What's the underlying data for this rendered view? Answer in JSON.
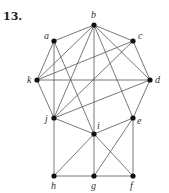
{
  "problem_number": "13.",
  "graph": {
    "nodes": [
      {
        "id": "a",
        "x": 54,
        "y": 41,
        "lx": 44,
        "ly": 39
      },
      {
        "id": "b",
        "x": 94,
        "y": 25,
        "lx": 91,
        "ly": 18
      },
      {
        "id": "c",
        "x": 133,
        "y": 41,
        "lx": 138,
        "ly": 39
      },
      {
        "id": "k",
        "x": 37,
        "y": 80,
        "lx": 27,
        "ly": 83
      },
      {
        "id": "d",
        "x": 150,
        "y": 80,
        "lx": 155,
        "ly": 83
      },
      {
        "id": "j",
        "x": 54,
        "y": 118,
        "lx": 45,
        "ly": 122
      },
      {
        "id": "e",
        "x": 133,
        "y": 118,
        "lx": 137,
        "ly": 124
      },
      {
        "id": "i",
        "x": 94,
        "y": 134,
        "lx": 97,
        "ly": 129
      },
      {
        "id": "h",
        "x": 54,
        "y": 176,
        "lx": 51,
        "ly": 189
      },
      {
        "id": "g",
        "x": 94,
        "y": 176,
        "lx": 91,
        "ly": 189
      },
      {
        "id": "f",
        "x": 133,
        "y": 176,
        "lx": 130,
        "ly": 189
      }
    ],
    "edges": [
      [
        "a",
        "b"
      ],
      [
        "b",
        "c"
      ],
      [
        "c",
        "d"
      ],
      [
        "d",
        "e"
      ],
      [
        "e",
        "f"
      ],
      [
        "f",
        "g"
      ],
      [
        "g",
        "h"
      ],
      [
        "h",
        "j"
      ],
      [
        "j",
        "k"
      ],
      [
        "k",
        "a"
      ],
      [
        "a",
        "j"
      ],
      [
        "a",
        "i"
      ],
      [
        "b",
        "k"
      ],
      [
        "b",
        "d"
      ],
      [
        "b",
        "j"
      ],
      [
        "b",
        "i"
      ],
      [
        "b",
        "e"
      ],
      [
        "c",
        "k"
      ],
      [
        "c",
        "j"
      ],
      [
        "d",
        "k"
      ],
      [
        "d",
        "j"
      ],
      [
        "j",
        "i"
      ],
      [
        "i",
        "e"
      ],
      [
        "i",
        "h"
      ],
      [
        "i",
        "g"
      ],
      [
        "i",
        "f"
      ],
      [
        "e",
        "g"
      ]
    ]
  }
}
